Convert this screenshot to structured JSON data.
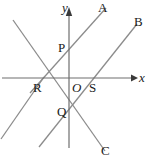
{
  "figure": {
    "width": 148,
    "height": 159,
    "background": "#ffffff",
    "line_color": "#8c8c8c",
    "axis_color": "#6e6e6e",
    "label_color": "#1a1a1a"
  },
  "axes": {
    "x": {
      "label": "x",
      "label_x": 139,
      "label_y": 71,
      "y_pixel": 78,
      "x_start": 2,
      "x_end": 134,
      "arrow": "right"
    },
    "y": {
      "label": "y",
      "label_x": 62,
      "label_y": 1,
      "x_pixel": 69,
      "y_start": 8,
      "y_end": 148,
      "arrow": "up"
    },
    "origin": {
      "label": "O",
      "label_x": 72,
      "label_y": 81,
      "x": 69,
      "y": 78
    }
  },
  "points": [
    {
      "name": "P",
      "label": "P",
      "x": 69,
      "y": 48,
      "label_x": 58,
      "label_y": 41
    },
    {
      "name": "Q",
      "label": "Q",
      "x": 69,
      "y": 112,
      "label_x": 57,
      "label_y": 105
    },
    {
      "name": "R",
      "label": "R",
      "x": 43,
      "y": 78,
      "label_x": 33,
      "label_y": 81
    },
    {
      "name": "S",
      "label": "S",
      "x": 93,
      "y": 78,
      "label_x": 89,
      "label_y": 81
    }
  ],
  "rays": [
    {
      "name": "A",
      "label": "A",
      "label_x": 98,
      "label_y": 1
    },
    {
      "name": "B",
      "label": "B",
      "label_x": 134,
      "label_y": 15
    },
    {
      "name": "C",
      "label": "C",
      "label_x": 101,
      "label_y": 144
    }
  ],
  "lines": [
    {
      "name": "line-RPA",
      "description": "rising line through R, P and ray endpoint A",
      "x1": 31,
      "y1": 92,
      "x2": 105,
      "y2": 9
    },
    {
      "name": "line-QSB",
      "description": "rising line through Q, S and ray endpoint B",
      "x1": 40,
      "y1": 145,
      "x2": 136,
      "y2": 25
    },
    {
      "name": "line-falling-through-R-Q-C",
      "description": "falling line from upper-left through R and Q to ray endpoint C",
      "x1": 13,
      "y1": 20,
      "x2": 104,
      "y2": 150
    },
    {
      "name": "line-falling-left",
      "description": "falling line from R down-left to lower-left corner",
      "x1": 43,
      "y1": 78,
      "x2": 2,
      "y2": 137
    }
  ]
}
